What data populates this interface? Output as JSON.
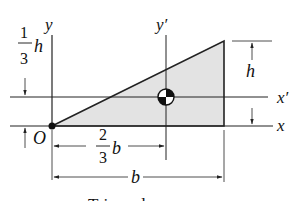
{
  "figure": {
    "caption": "Triangular area",
    "labels": {
      "y": "y",
      "y_prime": "y′",
      "x": "x",
      "x_prime": "x′",
      "origin": "O",
      "h": "h",
      "b": "b",
      "one_third_num": "1",
      "one_third_den": "3",
      "one_third_var": "h",
      "two_thirds_num": "2",
      "two_thirds_den": "3",
      "two_thirds_var": "b"
    },
    "colors": {
      "fill": "#e3e3e3",
      "line": "#222222"
    }
  }
}
